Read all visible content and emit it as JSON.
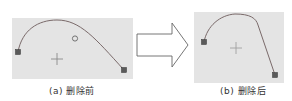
{
  "figure": {
    "panels": [
      {
        "id": "a",
        "caption": "(a) 删除前",
        "background": "#e4e4e4",
        "curve_color": "#7a6a6a",
        "endpoint_color": "#5a5a5a",
        "has_control_point": true
      },
      {
        "id": "b",
        "caption": "(b) 删除后",
        "background": "#e4e4e4",
        "curve_color": "#7a6a6a",
        "endpoint_color": "#5a5a5a",
        "has_control_point": false
      }
    ],
    "arrow": {
      "direction": "right",
      "stroke": "#555555"
    }
  }
}
